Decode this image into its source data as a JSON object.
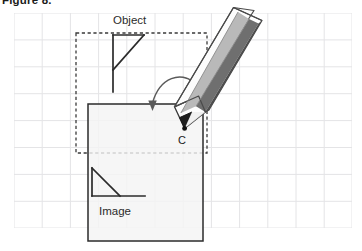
{
  "figure": {
    "caption": "Figure 8.",
    "background_color": "#ffffff"
  },
  "grid": {
    "name": "graph-paper-grid",
    "line_color": "#e2e2e4",
    "x_start": 14,
    "y_start": 13,
    "x_end": 352,
    "y_end": 228,
    "cell_width": 28.2,
    "cell_height": 26.9,
    "columns": 12,
    "rows": 8
  },
  "labels": {
    "object": "Object",
    "image": "Image",
    "center_point": "C"
  },
  "colors": {
    "stroke_dark": "#2b2b2b",
    "dashed_stroke": "#3a3a3a",
    "paper_fill": "#f4f4f4",
    "pencil_body_light": "#ffffff",
    "pencil_body_mid": "#b9b9b9",
    "pencil_body_dark": "#6e6e6e",
    "pencil_edge": "#545454",
    "pencil_tip": "#1a1a1a",
    "arrow_color": "#5a5a5a"
  },
  "shapes": {
    "dashed_rect": {
      "name": "object-bounding-box",
      "x": 76,
      "y": 33,
      "width": 131,
      "height": 120
    },
    "paper_rect": {
      "name": "image-plane-paper",
      "x": 88,
      "y": 104,
      "width": 115,
      "height": 137
    },
    "object_flag": {
      "name": "object-flag-shape",
      "vertical_x": 113,
      "top_y": 35,
      "bottom_y": 92,
      "horizontal_end_x": 144,
      "diagonal_end_y": 70
    },
    "image_flag": {
      "name": "image-flag-shape",
      "vertical_x": 92,
      "top_y": 168,
      "bottom_y": 196,
      "horizontal_end_x": 145,
      "diagonal_end_x": 120
    },
    "curved_arrow": {
      "name": "projection-arrow",
      "start_x": 193,
      "start_y": 82,
      "end_x": 152,
      "end_y": 110
    },
    "pencil": {
      "name": "pencil-illustration",
      "tip_x": 184,
      "tip_y": 128,
      "angle_degrees": -48
    }
  }
}
